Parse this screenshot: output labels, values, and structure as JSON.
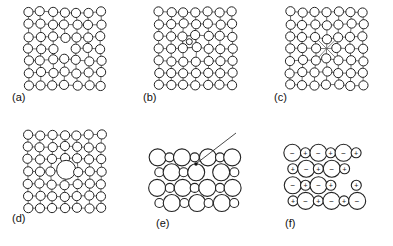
{
  "figure": {
    "background_color": "#ffffff",
    "atom_stroke_color": "#222222",
    "bond_stroke_color": "#555555",
    "atom_fill_color": "#ffffff",
    "panel_count": 6
  },
  "panels": [
    {
      "id": "a",
      "label": "(a)",
      "defect_type": "vacancy",
      "lattice": "square",
      "columns": 7,
      "rows": 7,
      "atom_radius": 4.6,
      "has_bonds": true,
      "distortion": "inward-relaxation-near-center",
      "center_feature": "missing-atom"
    },
    {
      "id": "b",
      "label": "(b)",
      "defect_type": "interstitial",
      "lattice": "square",
      "columns": 7,
      "rows": 7,
      "atom_radius": 4.6,
      "has_bonds": true,
      "distortion": "outward-relaxation-near-center",
      "center_feature": "small-interstitial-atom",
      "interstitial_radius": 3.0
    },
    {
      "id": "c",
      "label": "(c)",
      "defect_type": "vacancy-with-collapse",
      "lattice": "square",
      "columns": 7,
      "rows": 7,
      "atom_radius": 4.6,
      "has_bonds": true,
      "distortion": "strong-inward-collapse",
      "center_feature": "collapsed-vacancy"
    },
    {
      "id": "d",
      "label": "(d)",
      "defect_type": "substitutional-impurity",
      "lattice": "square",
      "columns": 7,
      "rows": 7,
      "atom_radius": 4.6,
      "has_bonds": true,
      "distortion": "outward-strain-around-large-atom",
      "center_feature": "large-substitutional-atom",
      "impurity_radius": 9.5
    },
    {
      "id": "e",
      "label": "(e)",
      "defect_type": "vacancy-in-close-packed-ionic",
      "lattice": "close-packed-ionic",
      "rows": 4,
      "large_ion_radius": 8.5,
      "small_ion_radius": 4.5,
      "has_bonds": false,
      "has_pointer_arrow": true,
      "pointer_target": "defect-site"
    },
    {
      "id": "f",
      "label": "(f)",
      "defect_type": "schottky-defect-ionic",
      "lattice": "close-packed-ionic",
      "rows": 4,
      "large_ion_radius": 8.5,
      "small_ion_radius": 5.0,
      "has_bonds": false,
      "has_charges": true,
      "anion_symbol": "−",
      "cation_symbol": "+",
      "anion_label": "negative ion",
      "cation_label": "positive ion",
      "charge_font_size": 7
    }
  ],
  "ion_rows_f": [
    [
      "-",
      "+",
      "-",
      "+",
      "-",
      "+"
    ],
    [
      "+",
      "-",
      "-",
      "+",
      "-",
      ""
    ],
    [
      "-",
      "+",
      "-",
      "+",
      "",
      "-"
    ],
    [
      "+",
      "-",
      "+",
      "-",
      "+",
      "-"
    ]
  ]
}
